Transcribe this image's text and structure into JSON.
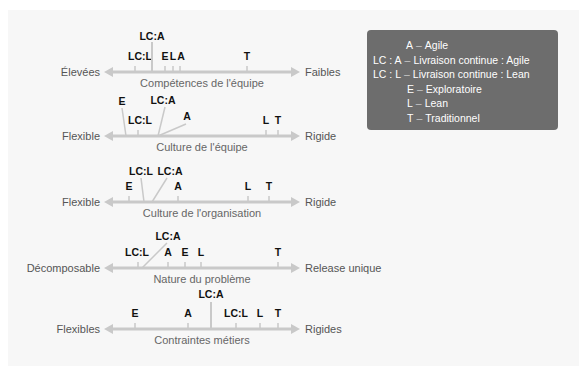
{
  "legend": {
    "items": [
      {
        "key": "A",
        "desc": "Agile",
        "indent": 33
      },
      {
        "key": "LC : A",
        "desc": "Livraison continue : Agile",
        "indent": 0
      },
      {
        "key": "LC : L",
        "desc": "Livraison continue : Lean",
        "indent": 0
      },
      {
        "key": "E",
        "desc": "Exploratoire",
        "indent": 34
      },
      {
        "key": "L",
        "desc": "Lean",
        "indent": 34
      },
      {
        "key": "T",
        "desc": "Traditionnel",
        "indent": 34
      }
    ],
    "colors": {
      "background": "#6d6d6d",
      "text": "#ffffff"
    }
  },
  "colors": {
    "axis": "#c9c9c9",
    "marker_text": "#111111",
    "panel": "#f7f7f7"
  },
  "chart_data": {
    "type": "diagram",
    "axes": [
      {
        "title": "Compétences de l'équipe",
        "left": "Élevées",
        "right": "Faibles",
        "y": 72,
        "markers": [
          {
            "label": "LC:L",
            "x": 135,
            "lx": 140,
            "ly": 60,
            "tick": 6
          },
          {
            "label": "LC:A",
            "x": 152,
            "lx": 152,
            "ly": 40,
            "tick": 30
          },
          {
            "label": "E",
            "x": 165,
            "lx": 165,
            "ly": 60,
            "tick": 6
          },
          {
            "label": "L",
            "x": 173,
            "lx": 173,
            "ly": 60,
            "tick": 6
          },
          {
            "label": "A",
            "x": 180,
            "lx": 181,
            "ly": 60,
            "tick": 6
          },
          {
            "label": "T",
            "x": 247,
            "lx": 247,
            "ly": 60,
            "tick": 6
          }
        ]
      },
      {
        "title": "Culture de l'équipe",
        "left": "Flexible",
        "right": "Rigide",
        "y": 136,
        "markers": [
          {
            "label": "E",
            "x": 126,
            "lx": 122,
            "ly": 105,
            "line": [
              122,
              108,
              126,
              136
            ]
          },
          {
            "label": "LC:L",
            "x": 138,
            "lx": 140,
            "ly": 124,
            "tick": 6
          },
          {
            "label": "LC:A",
            "x": 158,
            "lx": 163,
            "ly": 104,
            "line": [
              165,
              107,
              158,
              136
            ]
          },
          {
            "label": "A",
            "x": 158,
            "lx": 187,
            "ly": 120,
            "line": [
              158,
              136,
              186,
              124
            ]
          },
          {
            "label": "L",
            "x": 266,
            "lx": 266,
            "ly": 124,
            "tick": 6
          },
          {
            "label": "T",
            "x": 278,
            "lx": 278,
            "ly": 124,
            "tick": 6
          }
        ]
      },
      {
        "title": "Culture de l'organisation",
        "left": "Flexible",
        "right": "Rigide",
        "y": 202,
        "markers": [
          {
            "label": "E",
            "x": 129,
            "lx": 129,
            "ly": 190,
            "tick": 6
          },
          {
            "label": "LC:L",
            "x": 144,
            "lx": 141,
            "ly": 175,
            "line": [
              141,
              178,
              144,
              202
            ]
          },
          {
            "label": "LC:A",
            "x": 152,
            "lx": 170,
            "ly": 175,
            "line": [
              167,
              178,
              152,
              202
            ]
          },
          {
            "label": "A",
            "x": 178,
            "lx": 178,
            "ly": 190,
            "tick": 6
          },
          {
            "label": "L",
            "x": 248,
            "lx": 248,
            "ly": 190,
            "tick": 6
          },
          {
            "label": "T",
            "x": 269,
            "lx": 269,
            "ly": 190,
            "tick": 6
          }
        ]
      },
      {
        "title": "Nature du problème",
        "left": "Décomposable",
        "right": "Release unique",
        "y": 268,
        "markers": [
          {
            "label": "LC:L",
            "x": 138,
            "lx": 137,
            "ly": 256,
            "tick": 6
          },
          {
            "label": "LC:A",
            "x": 142,
            "lx": 168,
            "ly": 240,
            "line": [
              167,
              243,
              142,
              268
            ]
          },
          {
            "label": "A",
            "x": 168,
            "lx": 168,
            "ly": 256,
            "tick": 6
          },
          {
            "label": "E",
            "x": 185,
            "lx": 185,
            "ly": 256,
            "tick": 6
          },
          {
            "label": "L",
            "x": 201,
            "lx": 201,
            "ly": 256,
            "tick": 6
          },
          {
            "label": "T",
            "x": 278,
            "lx": 278,
            "ly": 256,
            "tick": 6
          }
        ]
      },
      {
        "title": "Contraintes métiers",
        "left": "Flexibles",
        "right": "Rigides",
        "y": 329,
        "markers": [
          {
            "label": "E",
            "x": 135,
            "lx": 135,
            "ly": 317,
            "tick": 6
          },
          {
            "label": "A",
            "x": 188,
            "lx": 188,
            "ly": 317,
            "tick": 6
          },
          {
            "label": "LC:A",
            "x": 211,
            "lx": 211,
            "ly": 298,
            "tick": 27
          },
          {
            "label": "LC:L",
            "x": 236,
            "lx": 236,
            "ly": 317,
            "tick": 6
          },
          {
            "label": "L",
            "x": 260,
            "lx": 260,
            "ly": 317,
            "tick": 6
          },
          {
            "label": "T",
            "x": 278,
            "lx": 278,
            "ly": 317,
            "tick": 6
          }
        ]
      }
    ],
    "axis_range": [
      104,
      300
    ]
  }
}
